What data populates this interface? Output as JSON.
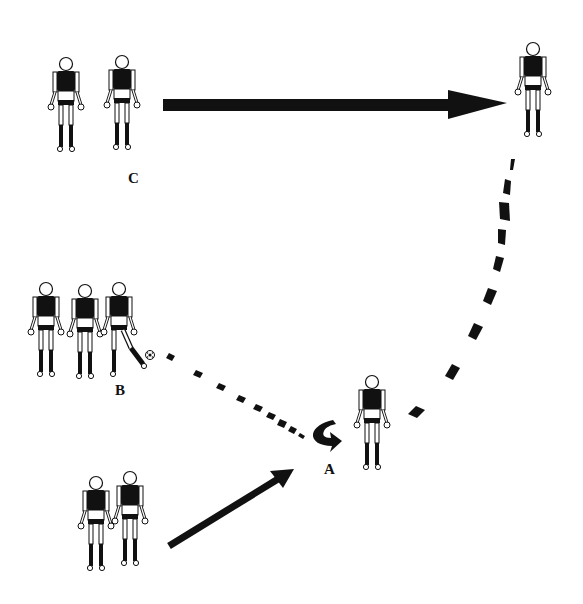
{
  "diagram": {
    "type": "football drill",
    "colors": {
      "ink": "#111111",
      "background": "#ffffff"
    },
    "groups": [
      {
        "id": "C",
        "label": "C",
        "players": 2,
        "label_pos": [
          133,
          183
        ]
      },
      {
        "id": "B",
        "label": "B",
        "players": 3,
        "label_pos": [
          120,
          393
        ],
        "has_ball": true
      },
      {
        "id": "A",
        "label": "A",
        "players": 1,
        "label_pos": [
          328,
          473
        ]
      },
      {
        "id": "target",
        "label": "",
        "players": 1
      },
      {
        "id": "bottom",
        "label": "",
        "players": 2
      }
    ],
    "arrows": [
      {
        "name": "run-c-to-target",
        "style": "solid-thick",
        "from": [
          163,
          105
        ],
        "to": [
          507,
          103
        ]
      },
      {
        "name": "run-target-to-a",
        "style": "dashed-curve",
        "from": [
          513,
          158
        ],
        "to": [
          410,
          418
        ]
      },
      {
        "name": "pass-b-to-a",
        "style": "dotted",
        "from": [
          165,
          355
        ],
        "to": [
          305,
          435
        ]
      },
      {
        "name": "run-bottom-to-a",
        "style": "solid",
        "from": [
          167,
          548
        ],
        "to": [
          293,
          470
        ]
      },
      {
        "name": "turn-at-a",
        "style": "curved-turn-symbol",
        "at": [
          327,
          430
        ]
      }
    ]
  },
  "labels": {
    "A": "A",
    "B": "B",
    "C": "C"
  }
}
